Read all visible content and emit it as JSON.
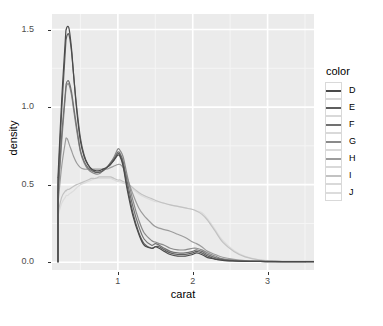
{
  "axes": {
    "x_title": "carat",
    "y_title": "density",
    "x_ticks": [
      "1",
      "2",
      "3"
    ],
    "y_ticks": [
      "0.0",
      "0.5",
      "1.0",
      "1.5"
    ]
  },
  "legend": {
    "title": "color",
    "items": [
      {
        "label": "D",
        "color": "#4a4a4a"
      },
      {
        "label": "E",
        "color": "#5e5e5e"
      },
      {
        "label": "F",
        "color": "#717171"
      },
      {
        "label": "G",
        "color": "#8a8a8a"
      },
      {
        "label": "H",
        "color": "#9c9c9c"
      },
      {
        "label": "I",
        "color": "#c2c2c2"
      },
      {
        "label": "J",
        "color": "#dcdcdc"
      }
    ]
  },
  "caption": "",
  "theme": {
    "panel_background": "#ebebeb",
    "gridline_major": "#ffffff",
    "gridline_minor": "#f5f5f5",
    "axis_text": "#4d4d4d",
    "axis_title": "#000000",
    "legend_key_background": "#ffffff",
    "legend_key_border": "#d9d9d9"
  },
  "chart_data": {
    "type": "line",
    "title": "",
    "subtitle": "",
    "xlabel": "carat",
    "ylabel": "density",
    "xlim": [
      0.12,
      3.62
    ],
    "ylim": [
      -0.05,
      1.6
    ],
    "grid": true,
    "legend_position": "right",
    "legend_title": "color",
    "x_ticks": [
      1,
      2,
      3
    ],
    "y_ticks": [
      0.0,
      0.5,
      1.0,
      1.5
    ],
    "x_minor_ticks": [
      0.5,
      1.5,
      2.5,
      3.5
    ],
    "y_minor_ticks": [
      0.25,
      0.75,
      1.25
    ],
    "x": [
      0.2,
      0.25,
      0.3,
      0.31,
      0.33,
      0.35,
      0.38,
      0.41,
      0.45,
      0.5,
      0.55,
      0.6,
      0.65,
      0.7,
      0.75,
      0.8,
      0.85,
      0.9,
      0.95,
      1.0,
      1.03,
      1.07,
      1.12,
      1.2,
      1.28,
      1.35,
      1.45,
      1.5,
      1.55,
      1.62,
      1.7,
      1.8,
      1.9,
      2.0,
      2.05,
      2.12,
      2.2,
      2.3,
      2.4,
      2.55,
      2.7,
      2.9,
      3.1,
      3.3,
      3.5
    ],
    "series": [
      {
        "name": "D",
        "color": "#4a4a4a",
        "values": [
          0.55,
          1.05,
          1.45,
          1.5,
          1.52,
          1.5,
          1.38,
          1.2,
          0.98,
          0.78,
          0.68,
          0.63,
          0.6,
          0.59,
          0.59,
          0.6,
          0.61,
          0.63,
          0.66,
          0.69,
          0.68,
          0.62,
          0.48,
          0.3,
          0.18,
          0.11,
          0.09,
          0.1,
          0.09,
          0.07,
          0.05,
          0.04,
          0.04,
          0.05,
          0.06,
          0.05,
          0.03,
          0.02,
          0.012,
          0.008,
          0.006,
          0.005,
          0.004,
          0.004,
          0.004
        ]
      },
      {
        "name": "E",
        "color": "#5e5e5e",
        "values": [
          0.5,
          0.98,
          1.38,
          1.44,
          1.47,
          1.46,
          1.36,
          1.2,
          1.0,
          0.8,
          0.69,
          0.63,
          0.6,
          0.58,
          0.58,
          0.59,
          0.61,
          0.63,
          0.66,
          0.7,
          0.69,
          0.63,
          0.5,
          0.32,
          0.19,
          0.12,
          0.09,
          0.1,
          0.1,
          0.08,
          0.06,
          0.05,
          0.05,
          0.06,
          0.07,
          0.06,
          0.04,
          0.02,
          0.014,
          0.009,
          0.006,
          0.005,
          0.004,
          0.004,
          0.004
        ]
      },
      {
        "name": "F",
        "color": "#717171",
        "values": [
          0.45,
          0.82,
          1.1,
          1.15,
          1.17,
          1.16,
          1.1,
          1.0,
          0.87,
          0.72,
          0.65,
          0.61,
          0.59,
          0.58,
          0.58,
          0.59,
          0.61,
          0.64,
          0.67,
          0.71,
          0.7,
          0.65,
          0.53,
          0.36,
          0.23,
          0.15,
          0.11,
          0.12,
          0.11,
          0.09,
          0.07,
          0.06,
          0.06,
          0.07,
          0.08,
          0.07,
          0.05,
          0.03,
          0.018,
          0.011,
          0.007,
          0.005,
          0.004,
          0.004,
          0.004
        ]
      },
      {
        "name": "G",
        "color": "#8a8a8a",
        "values": [
          0.42,
          0.78,
          1.08,
          1.13,
          1.15,
          1.14,
          1.08,
          0.98,
          0.85,
          0.71,
          0.64,
          0.6,
          0.58,
          0.57,
          0.57,
          0.59,
          0.61,
          0.64,
          0.68,
          0.73,
          0.72,
          0.68,
          0.57,
          0.4,
          0.27,
          0.19,
          0.14,
          0.13,
          0.12,
          0.11,
          0.09,
          0.08,
          0.08,
          0.09,
          0.09,
          0.08,
          0.06,
          0.04,
          0.022,
          0.013,
          0.008,
          0.006,
          0.005,
          0.004,
          0.004
        ]
      },
      {
        "name": "H",
        "color": "#9c9c9c",
        "values": [
          0.38,
          0.62,
          0.78,
          0.8,
          0.79,
          0.76,
          0.72,
          0.68,
          0.64,
          0.61,
          0.6,
          0.6,
          0.6,
          0.6,
          0.6,
          0.6,
          0.6,
          0.61,
          0.62,
          0.63,
          0.63,
          0.61,
          0.55,
          0.44,
          0.35,
          0.3,
          0.25,
          0.23,
          0.22,
          0.21,
          0.2,
          0.18,
          0.16,
          0.13,
          0.12,
          0.1,
          0.07,
          0.05,
          0.032,
          0.018,
          0.01,
          0.006,
          0.005,
          0.004,
          0.004
        ]
      },
      {
        "name": "I",
        "color": "#c2c2c2",
        "values": [
          0.32,
          0.42,
          0.46,
          0.46,
          0.47,
          0.47,
          0.48,
          0.49,
          0.5,
          0.51,
          0.52,
          0.53,
          0.54,
          0.54,
          0.55,
          0.55,
          0.55,
          0.55,
          0.54,
          0.53,
          0.53,
          0.52,
          0.51,
          0.48,
          0.45,
          0.43,
          0.41,
          0.4,
          0.39,
          0.38,
          0.37,
          0.36,
          0.35,
          0.34,
          0.33,
          0.31,
          0.27,
          0.2,
          0.13,
          0.07,
          0.035,
          0.014,
          0.008,
          0.006,
          0.006
        ]
      },
      {
        "name": "J",
        "color": "#dcdcdc",
        "values": [
          0.3,
          0.38,
          0.42,
          0.43,
          0.43,
          0.44,
          0.45,
          0.46,
          0.48,
          0.5,
          0.51,
          0.52,
          0.53,
          0.54,
          0.54,
          0.54,
          0.54,
          0.54,
          0.53,
          0.52,
          0.52,
          0.51,
          0.5,
          0.47,
          0.44,
          0.42,
          0.4,
          0.39,
          0.39,
          0.38,
          0.37,
          0.36,
          0.35,
          0.34,
          0.33,
          0.32,
          0.28,
          0.21,
          0.14,
          0.075,
          0.038,
          0.015,
          0.008,
          0.006,
          0.006
        ]
      }
    ]
  }
}
